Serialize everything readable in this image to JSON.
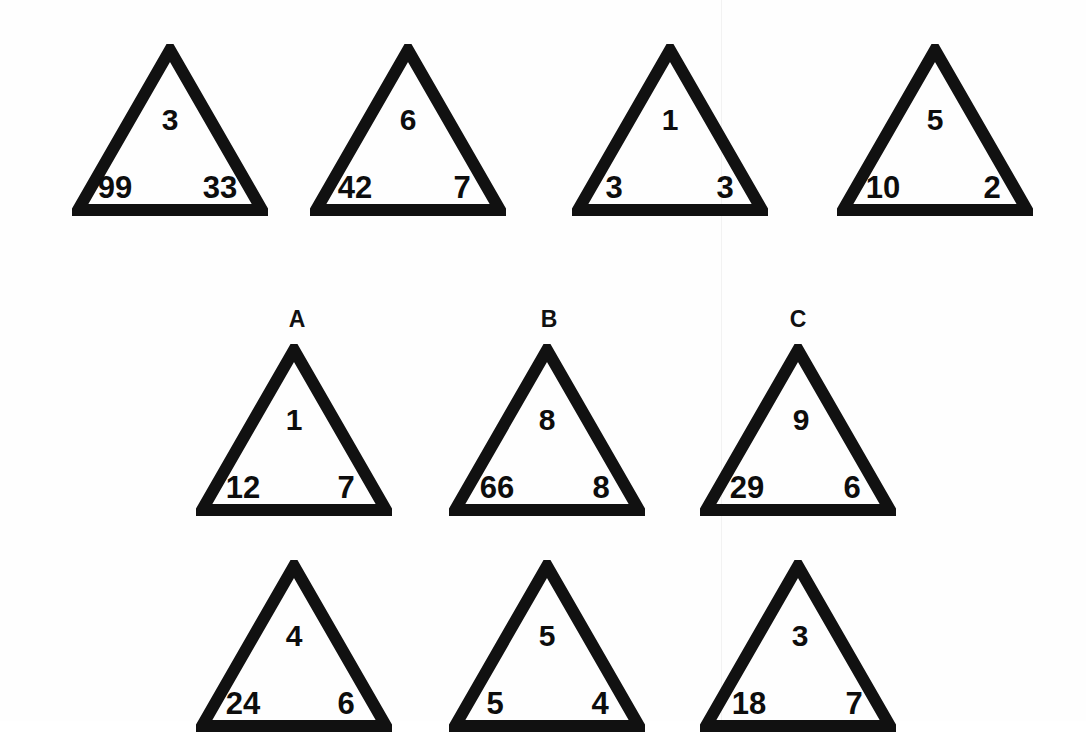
{
  "meta": {
    "stroke_color": "#111111",
    "text_color": "#0d0d0d",
    "background": "#fefefe"
  },
  "rows": [
    {
      "row_name": "examples-row",
      "triangles": [
        {
          "label": "",
          "top": "3",
          "left": "99",
          "right": "33"
        },
        {
          "label": "",
          "top": "6",
          "left": "42",
          "right": "7"
        },
        {
          "label": "",
          "top": "1",
          "left": "3",
          "right": "3"
        },
        {
          "label": "",
          "top": "5",
          "left": "10",
          "right": "2"
        }
      ]
    },
    {
      "row_name": "options-row",
      "triangles": [
        {
          "label": "A",
          "top": "1",
          "left": "12",
          "right": "7"
        },
        {
          "label": "B",
          "top": "8",
          "left": "66",
          "right": "8"
        },
        {
          "label": "C",
          "top": "9",
          "left": "29",
          "right": "6"
        }
      ]
    },
    {
      "row_name": "options-row-2",
      "triangles": [
        {
          "label": "",
          "top": "4",
          "left": "24",
          "right": "6"
        },
        {
          "label": "",
          "top": "5",
          "left": "5",
          "right": "4"
        },
        {
          "label": "",
          "top": "3",
          "left": "18",
          "right": "7"
        }
      ]
    }
  ]
}
